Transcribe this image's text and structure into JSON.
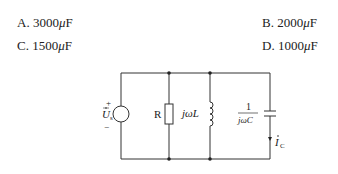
{
  "options": [
    {
      "letter": "A.",
      "value": "3000",
      "unit_prefix": "μ",
      "unit": "F"
    },
    {
      "letter": "B.",
      "value": "2000",
      "unit_prefix": "μ",
      "unit": "F"
    },
    {
      "letter": "C.",
      "value": "1500",
      "unit_prefix": "μ",
      "unit": "F"
    },
    {
      "letter": "D.",
      "value": "1000",
      "unit_prefix": "μ",
      "unit": "F"
    }
  ],
  "circuit": {
    "source_label": "U",
    "source_subscript": "s",
    "source_plus": "+",
    "source_minus": "−",
    "resistor_label": "R",
    "inductor_label": "jωL",
    "capacitor_label_num": "1",
    "capacitor_label_den": "jωC",
    "current_label": "I",
    "current_subscript": "C"
  }
}
